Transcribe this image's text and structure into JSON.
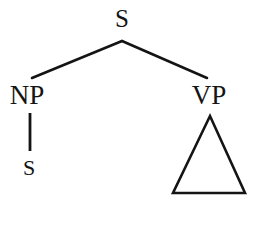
{
  "figure": {
    "kind": "syntax-tree-diagram",
    "width": 270,
    "height": 232,
    "background_color": "#ffffff",
    "stroke_color": "#141414",
    "text_color": "#141414",
    "stroke_width": 2.6
  },
  "nodes": {
    "root": {
      "label": "S",
      "x": 122,
      "y": 31
    },
    "np": {
      "label": "NP",
      "x": 27,
      "y": 109
    },
    "vp": {
      "label": "VP",
      "x": 209,
      "y": 109
    },
    "np_child": {
      "label": "S",
      "x": 29,
      "y": 179
    }
  },
  "edges": [
    {
      "name": "root-to-np",
      "x1": 122,
      "y1": 41,
      "x2": 32,
      "y2": 78
    },
    {
      "name": "root-to-vp",
      "x1": 122,
      "y1": 41,
      "x2": 207,
      "y2": 78
    },
    {
      "name": "np-to-s",
      "x1": 30,
      "y1": 113,
      "x2": 30,
      "y2": 151
    }
  ],
  "triangle": {
    "name": "vp-triangle",
    "apex_x": 210,
    "apex_y": 116,
    "base_left_x": 173,
    "base_right_x": 245,
    "base_y": 193
  }
}
